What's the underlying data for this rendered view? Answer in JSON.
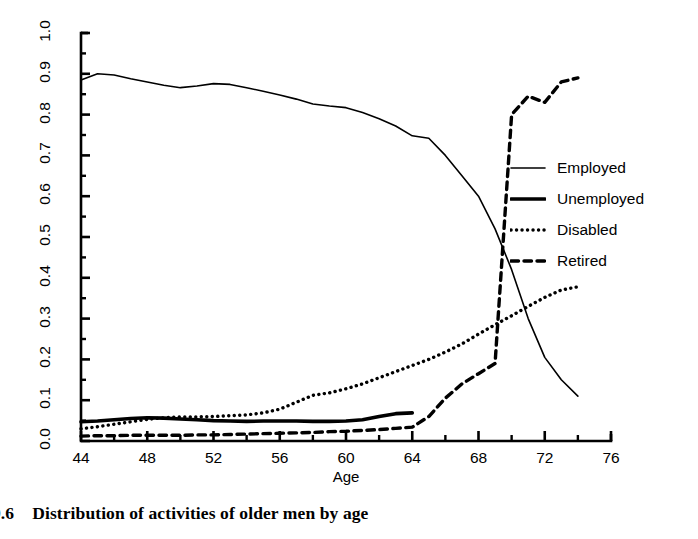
{
  "chart_data": {
    "type": "line",
    "title": "",
    "xlabel": "Age",
    "ylabel": "Fraction of Men",
    "xlim": [
      44,
      76
    ],
    "ylim": [
      0.0,
      1.0
    ],
    "grid": false,
    "legend_position": "right",
    "x_major_ticks": [
      44,
      48,
      52,
      56,
      60,
      64,
      68,
      72,
      76
    ],
    "x_minor_ticks": [
      46,
      50,
      54,
      58,
      62,
      66,
      70,
      74
    ],
    "x_tick_labels": [
      "44",
      "48",
      "52",
      "56",
      "60",
      "64",
      "68",
      "72",
      "76"
    ],
    "y_major_ticks": [
      0.0,
      0.1,
      0.2,
      0.3,
      0.4,
      0.5,
      0.6,
      0.7,
      0.8,
      0.9,
      1.0
    ],
    "y_tick_labels": [
      "0.0",
      "0.1",
      "0.2",
      "0.3",
      "0.4",
      "0.5",
      "0.6",
      "0.7",
      "0.8",
      "0.9",
      "1.0"
    ],
    "x": [
      44,
      45,
      46,
      47,
      48,
      49,
      50,
      51,
      52,
      53,
      54,
      55,
      56,
      57,
      58,
      59,
      60,
      61,
      62,
      63,
      64,
      65,
      66,
      67,
      68,
      69,
      70,
      71,
      72,
      73,
      74
    ],
    "series": [
      {
        "name": "Employed",
        "style": "solid-thin",
        "color": "#000000",
        "values": [
          0.885,
          0.9,
          0.897,
          0.888,
          0.88,
          0.872,
          0.866,
          0.87,
          0.876,
          0.874,
          0.866,
          0.857,
          0.848,
          0.838,
          0.826,
          0.821,
          0.817,
          0.805,
          0.79,
          0.772,
          0.748,
          0.742,
          0.7,
          0.65,
          0.6,
          0.52,
          0.42,
          0.3,
          0.205,
          0.15,
          0.11
        ]
      },
      {
        "name": "Unemployed",
        "style": "solid-thick",
        "color": "#000000",
        "values": [
          0.047,
          0.049,
          0.052,
          0.055,
          0.057,
          0.056,
          0.054,
          0.052,
          0.05,
          0.049,
          0.048,
          0.049,
          0.049,
          0.049,
          0.048,
          0.048,
          0.049,
          0.052,
          0.06,
          0.067,
          0.069,
          0.066,
          0.06,
          0.054,
          0.05,
          0.052,
          0.053,
          0.054,
          0.055,
          0.055,
          0.055
        ]
      },
      {
        "name": "Disabled",
        "style": "dotted",
        "color": "#000000",
        "values": [
          0.03,
          0.035,
          0.041,
          0.047,
          0.053,
          0.057,
          0.059,
          0.059,
          0.06,
          0.062,
          0.064,
          0.069,
          0.078,
          0.095,
          0.112,
          0.118,
          0.128,
          0.14,
          0.155,
          0.17,
          0.185,
          0.2,
          0.218,
          0.238,
          0.262,
          0.285,
          0.307,
          0.33,
          0.352,
          0.37,
          0.378
        ]
      },
      {
        "name": "Retired",
        "style": "dashed",
        "color": "#000000",
        "values": [
          0.012,
          0.013,
          0.013,
          0.014,
          0.014,
          0.014,
          0.014,
          0.015,
          0.015,
          0.016,
          0.017,
          0.018,
          0.019,
          0.02,
          0.021,
          0.023,
          0.024,
          0.026,
          0.028,
          0.031,
          0.034,
          0.06,
          0.105,
          0.14,
          0.165,
          0.19,
          0.8,
          0.845,
          0.83,
          0.88,
          0.89
        ]
      }
    ],
    "series_notes": {
      "Employed": "thin solid line, ends at age 74 near 0.11",
      "Unemployed": "thick solid line, drawn only from age 44 to 64",
      "Disabled": "dotted line, rises to peak ~0.38 at age 64 then drops sharply",
      "Retired": "dashed line, flat near 0.01-0.03 until 58, rises to ~0.19 at 64, jumps to ~0.80 at 65, plateaus ~0.89 from 69 to 74"
    },
    "legend_entries": [
      "Employed",
      "Unemployed",
      "Disabled",
      "Retired"
    ]
  },
  "caption": {
    "number": "9.6",
    "text": "Distribution of activities of older men by age"
  },
  "axes": {
    "y_title": "Fraction of Men",
    "x_title": "Age"
  }
}
